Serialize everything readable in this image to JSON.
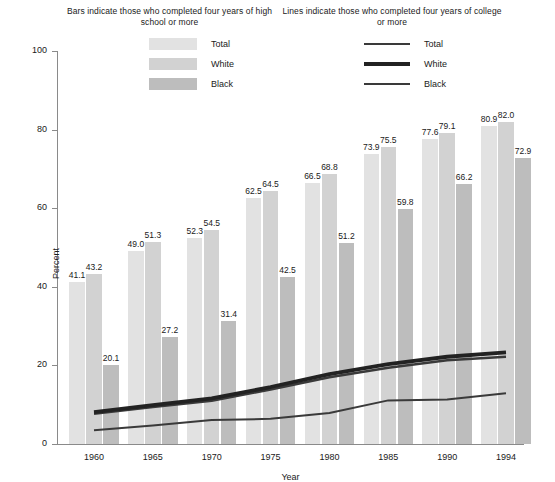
{
  "legend_bars": {
    "title": "Bars indicate those who completed four years of high school or more",
    "items": [
      {
        "label": "Total",
        "color": "#e2e2e2",
        "icon": "bar-swatch-total"
      },
      {
        "label": "White",
        "color": "#d2d2d2",
        "icon": "bar-swatch-white"
      },
      {
        "label": "Black",
        "color": "#bdbdbd",
        "icon": "bar-swatch-black"
      }
    ]
  },
  "legend_lines": {
    "title": "Lines indicate those who completed four years of college or more",
    "items": [
      {
        "label": "Total",
        "color": "#3a3a3a",
        "width": 2.6,
        "icon": "line-swatch-total"
      },
      {
        "label": "White",
        "color": "#222222",
        "width": 3.6,
        "icon": "line-swatch-white"
      },
      {
        "label": "Black",
        "color": "#3a3a3a",
        "width": 2.2,
        "icon": "line-swatch-black"
      }
    ]
  },
  "chart_data": {
    "type": "bar",
    "title": "",
    "xlabel": "Year",
    "ylabel": "Percent",
    "categories": [
      "1960",
      "1965",
      "1970",
      "1975",
      "1980",
      "1985",
      "1990",
      "1994"
    ],
    "ylim": [
      0,
      100
    ],
    "yticks": [
      0,
      20,
      40,
      60,
      80,
      100
    ],
    "grid": false,
    "legend_position": "top",
    "series": [
      {
        "name": "Total",
        "kind": "bar",
        "color": "#e2e2e2",
        "values": [
          41.1,
          49.0,
          52.3,
          62.5,
          66.5,
          73.9,
          77.6,
          80.9
        ]
      },
      {
        "name": "White",
        "kind": "bar",
        "color": "#d2d2d2",
        "values": [
          43.2,
          51.3,
          54.5,
          64.5,
          68.8,
          75.5,
          79.1,
          82.0
        ]
      },
      {
        "name": "Black",
        "kind": "bar",
        "color": "#bdbdbd",
        "values": [
          20.1,
          27.2,
          31.4,
          42.5,
          51.2,
          59.8,
          66.2,
          72.9
        ]
      },
      {
        "name": "Total",
        "kind": "line",
        "color": "#3a3a3a",
        "line_width": 2.6,
        "values": [
          7.7,
          9.4,
          11.0,
          13.9,
          17.0,
          19.4,
          21.3,
          22.2
        ]
      },
      {
        "name": "White",
        "kind": "line",
        "color": "#222222",
        "line_width": 3.8,
        "values": [
          8.1,
          9.9,
          11.6,
          14.5,
          17.8,
          20.3,
          22.2,
          23.3
        ]
      },
      {
        "name": "Black",
        "kind": "line",
        "color": "#3a3a3a",
        "line_width": 2.0,
        "values": [
          3.5,
          4.7,
          6.1,
          6.4,
          7.9,
          11.1,
          11.3,
          12.9
        ]
      }
    ]
  }
}
